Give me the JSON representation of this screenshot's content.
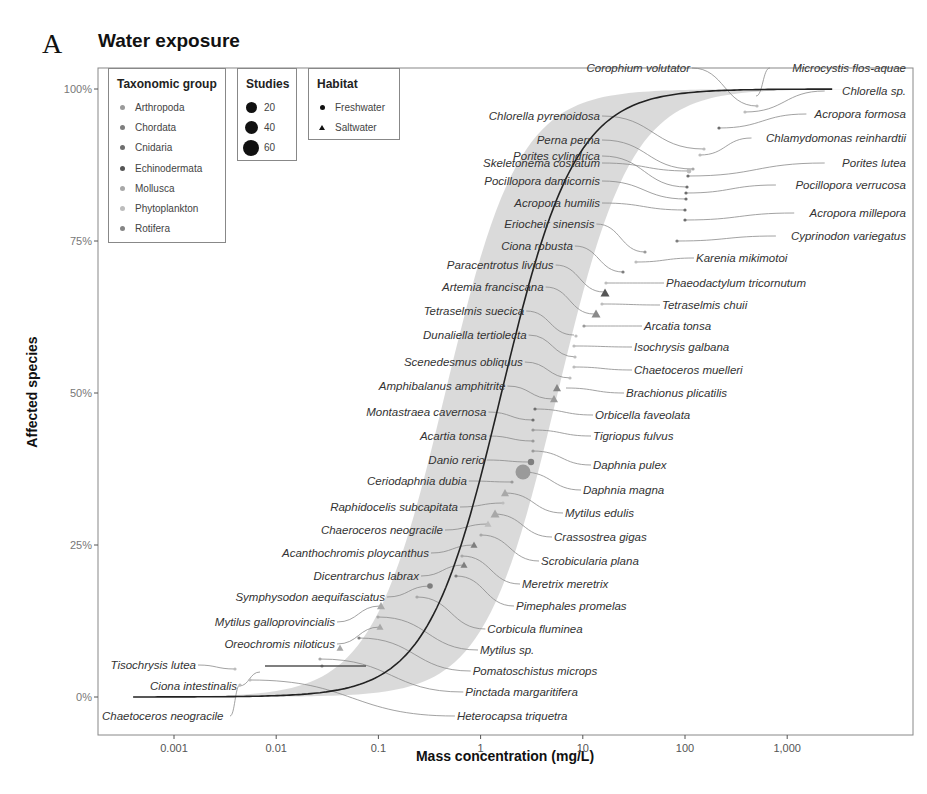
{
  "panel_letter": "A",
  "chart_data": {
    "type": "scatter",
    "title": "Water exposure",
    "xlabel": "Mass concentration (mg/L)",
    "ylabel": "Affected species",
    "x_scale": "log10",
    "x_ticks": [
      "0.001",
      "0.01",
      "0.1",
      "1",
      "10",
      "100",
      "1,000"
    ],
    "y_ticks": [
      "0%",
      "25%",
      "50%",
      "75%",
      "100%"
    ],
    "ylim": [
      0,
      100
    ],
    "grid": false,
    "fit": {
      "type": "sigmoid SSD curve with grey confidence band",
      "x_range_mg_L": [
        0.0004,
        3000
      ]
    },
    "legends": {
      "taxonomic_group": {
        "title": "Taxonomic group",
        "items": [
          {
            "label": "Arthropoda",
            "color": "#9a9a9a"
          },
          {
            "label": "Chordata",
            "color": "#7e7e7e"
          },
          {
            "label": "Cnidaria",
            "color": "#6e6e6e"
          },
          {
            "label": "Echinodermata",
            "color": "#555555"
          },
          {
            "label": "Mollusca",
            "color": "#a8a8a8"
          },
          {
            "label": "Phytoplankton",
            "color": "#bdbdbd"
          },
          {
            "label": "Rotifera",
            "color": "#858585"
          }
        ]
      },
      "studies": {
        "title": "Studies",
        "items": [
          {
            "label": "20",
            "size": 11
          },
          {
            "label": "40",
            "size": 13
          },
          {
            "label": "60",
            "size": 16
          }
        ]
      },
      "habitat": {
        "title": "Habitat",
        "items": [
          {
            "label": "Freshwater",
            "shape": "circle"
          },
          {
            "label": "Saltwater",
            "shape": "triangle"
          }
        ]
      }
    },
    "species_right": [
      {
        "name": "Microcystis flos-aquae",
        "x": 520,
        "y": 98.5
      },
      {
        "name": "Chlorella sp.",
        "x": 1000,
        "y": 97.5
      },
      {
        "name": "Corophium volutator",
        "x": 420,
        "y": 96.5
      },
      {
        "name": "Acropora formosa",
        "x": 330,
        "y": 95.5
      },
      {
        "name": "Chlorella pyrenoidosa",
        "x": 200,
        "y": 94.5
      },
      {
        "name": "Chlamydomonas reinhardtii",
        "x": 160,
        "y": 93
      },
      {
        "name": "Perna perna",
        "x": 140,
        "y": 91.5
      },
      {
        "name": "Skeletonema costatum",
        "x": 120,
        "y": 90
      },
      {
        "name": "Porites lutea",
        "x": 110,
        "y": 88.5
      },
      {
        "name": "Porites cylindrica",
        "x": 100,
        "y": 87
      },
      {
        "name": "Pocillopora verrucosa",
        "x": 100,
        "y": 85.5
      },
      {
        "name": "Pocillopora damicornis",
        "x": 100,
        "y": 84
      },
      {
        "name": "Acropora millepora",
        "x": 100,
        "y": 82.5
      },
      {
        "name": "Acropora humilis",
        "x": 100,
        "y": 81
      },
      {
        "name": "Cyprinodon variegatus",
        "x": 90,
        "y": 79.5
      },
      {
        "name": "Eriocheir sinensis",
        "x": 25,
        "y": 78
      },
      {
        "name": "Karenia mikimotoi",
        "x": 20,
        "y": 76.5
      },
      {
        "name": "Ciona robusta",
        "x": 18,
        "y": 75
      },
      {
        "name": "Phaeodactylum tricornutum",
        "x": 15,
        "y": 72.5
      },
      {
        "name": "Paracentrotus lividus",
        "x": 14,
        "y": 71.5
      },
      {
        "name": "Tetraselmis chuii",
        "x": 13,
        "y": 70
      },
      {
        "name": "Artemia franciscana",
        "x": 12,
        "y": 69
      },
      {
        "name": "Arcatia tonsa",
        "x": 8,
        "y": 67
      },
      {
        "name": "Tetraselmis suecica",
        "x": 8,
        "y": 66
      },
      {
        "name": "Isochrysis galbana",
        "x": 7,
        "y": 63.5
      },
      {
        "name": "Dunaliella tertiolecta",
        "x": 7,
        "y": 62.5
      },
      {
        "name": "Chaetoceros muelleri",
        "x": 6.5,
        "y": 60
      },
      {
        "name": "Scenedesmus obliquus",
        "x": 6,
        "y": 59
      },
      {
        "name": "Brachionus plicatilis",
        "x": 5,
        "y": 57
      },
      {
        "name": "Amphibalanus amphitrite",
        "x": 4.5,
        "y": 55.5
      },
      {
        "name": "Orbicella faveolata",
        "x": 3.5,
        "y": 54
      },
      {
        "name": "Montastraea cavernosa",
        "x": 3.3,
        "y": 53
      },
      {
        "name": "Tigriopus fulvus",
        "x": 3.2,
        "y": 51
      },
      {
        "name": "Acartia tonsa",
        "x": 3.1,
        "y": 50
      },
      {
        "name": "Daphnia pulex",
        "x": 3,
        "y": 48
      },
      {
        "name": "Danio rerio",
        "x": 3,
        "y": 47
      },
      {
        "name": "Daphnia magna",
        "x": 2.5,
        "y": 45,
        "studies": 60
      },
      {
        "name": "Ceriodaphnia dubia",
        "x": 2,
        "y": 44
      },
      {
        "name": "Mytilus edulis",
        "x": 2,
        "y": 42
      },
      {
        "name": "Raphidocelis subcapitata",
        "x": 1.8,
        "y": 41
      },
      {
        "name": "Crassostrea gigas",
        "x": 1.5,
        "y": 39
      },
      {
        "name": "Chaeroceros neogracile",
        "x": 1.3,
        "y": 37.5
      },
      {
        "name": "Scrobicularia plana",
        "x": 1.1,
        "y": 36
      },
      {
        "name": "Acanthochromis ploycanthus",
        "x": 1,
        "y": 34.5
      },
      {
        "name": "Meretrix meretrix",
        "x": 0.8,
        "y": 33
      },
      {
        "name": "Dicentrarchus labrax",
        "x": 0.8,
        "y": 31.5
      },
      {
        "name": "Pimephales promelas",
        "x": 0.7,
        "y": 30
      },
      {
        "name": "Symphysodon aequifasciatus",
        "x": 0.35,
        "y": 28.5
      },
      {
        "name": "Corbicula fluminea",
        "x": 0.1,
        "y": 27
      },
      {
        "name": "Mytilus galloprovincialis",
        "x": 0.1,
        "y": 25.5
      },
      {
        "name": "Mytilus sp.",
        "x": 0.1,
        "y": 24
      },
      {
        "name": "Oreochromis niloticus",
        "x": 0.07,
        "y": 22.5
      },
      {
        "name": "Pomatoschistus microps",
        "x": 0.04,
        "y": 21
      },
      {
        "name": "Tisochrysis lutea",
        "x": 0.004,
        "y": 19.5
      },
      {
        "name": "Pinctada margaritifera",
        "x": 0.03,
        "y": 18
      },
      {
        "name": "Ciona intestinalis",
        "x": 0.004,
        "y": 16.5
      },
      {
        "name": "Heterocapsa triquetra",
        "x": 0.004,
        "y": 15
      },
      {
        "name": "Chaetoceros neogracile",
        "x": 0.004,
        "y": 13.5
      }
    ]
  },
  "labels_left": [
    {
      "text": "Chlorella pyrenoidosa",
      "ly": 116,
      "tx": 704,
      "ty": 149
    },
    {
      "text": "Perna perna",
      "ly": 140,
      "tx": 693,
      "ty": 169
    },
    {
      "text": "Skeletonema costatum",
      "ly": 163,
      "tx": 689,
      "ty": 171
    },
    {
      "text": "Porites cylindrica",
      "ly": 156,
      "tx": 687,
      "ty": 187
    },
    {
      "text": "Pocillopora damicornis",
      "ly": 181,
      "tx": 686,
      "ty": 199
    },
    {
      "text": "Acropora humilis",
      "ly": 203,
      "tx": 685,
      "ty": 210
    },
    {
      "text": "Eriocheir sinensis",
      "ly": 224,
      "tx": 645,
      "ty": 252
    },
    {
      "text": "Ciona robusta",
      "ly": 246,
      "tx": 623,
      "ty": 272
    },
    {
      "text": "Paracentrotus lividus",
      "ly": 265,
      "tx": 604,
      "ty": 292
    },
    {
      "text": "Artemia franciscana",
      "ly": 287,
      "tx": 594,
      "ty": 314
    },
    {
      "text": "Tetraselmis suecica",
      "ly": 311,
      "tx": 574,
      "ty": 335
    },
    {
      "text": "Dunaliella tertiolecta",
      "ly": 335,
      "tx": 576,
      "ty": 357
    },
    {
      "text": "Scenedesmus obliquus",
      "ly": 362,
      "tx": 571,
      "ty": 378
    },
    {
      "text": "Amphibalanus amphitrite",
      "ly": 386,
      "tx": 553,
      "ty": 399
    },
    {
      "text": "Montastraea cavernosa",
      "ly": 412,
      "tx": 533,
      "ty": 420
    },
    {
      "text": "Acartia tonsa",
      "ly": 436,
      "tx": 533,
      "ty": 441
    },
    {
      "text": "Danio rerio",
      "ly": 460,
      "tx": 530,
      "ty": 462
    },
    {
      "text": "Ceriodaphnia dubia",
      "ly": 481,
      "tx": 512,
      "ty": 482
    },
    {
      "text": "Raphidocelis subcapitata",
      "ly": 507,
      "tx": 503,
      "ty": 503
    },
    {
      "text": "Chaeroceros neogracile",
      "ly": 530,
      "tx": 488,
      "ty": 524
    },
    {
      "text": "Acanthochromis ploycanthus",
      "ly": 553,
      "tx": 474,
      "ty": 545
    },
    {
      "text": "Dicentrarchus labrax",
      "ly": 576,
      "tx": 464,
      "ty": 565
    },
    {
      "text": "Symphysodon aequifasciatus",
      "ly": 597,
      "tx": 430,
      "ty": 586
    },
    {
      "text": "Mytilus galloprovincialis",
      "ly": 622,
      "tx": 380,
      "ty": 606
    },
    {
      "text": "Oreochromis niloticus",
      "ly": 644,
      "tx": 380,
      "ty": 627
    },
    {
      "text": "Tisochrysis lutea",
      "ly": 665,
      "tx": 235,
      "ty": 669
    },
    {
      "text": "Ciona intestinalis",
      "ly": 686,
      "tx": 260,
      "ty": 672
    },
    {
      "text": "Chaetoceros neogracile",
      "ly": 716,
      "tx": 240,
      "ty": 685
    }
  ],
  "labels_right": [
    {
      "text": "Corophium volutator",
      "ly": 68,
      "tx": 757,
      "ty": 106,
      "side": "left"
    },
    {
      "text": "Microcystis flos-aquae",
      "ly": 68,
      "tx": 756,
      "ty": 96
    },
    {
      "text": "Chlorella sp.",
      "ly": 91,
      "tx": 745,
      "ty": 112
    },
    {
      "text": "Acropora formosa",
      "ly": 114,
      "tx": 719,
      "ty": 128
    },
    {
      "text": "Chlamydomonas reinhardtii",
      "ly": 138,
      "tx": 700,
      "ty": 155
    },
    {
      "text": "Porites lutea",
      "ly": 163,
      "tx": 688,
      "ty": 176
    },
    {
      "text": "Pocillopora verrucosa",
      "ly": 185,
      "tx": 686,
      "ty": 193
    },
    {
      "text": "Acropora millepora",
      "ly": 213,
      "tx": 685,
      "ty": 220
    },
    {
      "text": "Cyprinodon variegatus",
      "ly": 236,
      "tx": 677,
      "ty": 241
    },
    {
      "text": "Karenia mikimotoi",
      "ly": 258,
      "tx": 636,
      "ty": 262
    },
    {
      "text": "Phaeodactylum tricornutum",
      "ly": 283,
      "tx": 606,
      "ty": 283
    },
    {
      "text": "Tetraselmis chuii",
      "ly": 305,
      "tx": 602,
      "ty": 304
    },
    {
      "text": "Arcatia tonsa",
      "ly": 326,
      "tx": 584,
      "ty": 326
    },
    {
      "text": "Isochrysis galbana",
      "ly": 347,
      "tx": 574,
      "ty": 346
    },
    {
      "text": "Chaetoceros muelleri",
      "ly": 370,
      "tx": 574,
      "ty": 367
    },
    {
      "text": "Brachionus plicatilis",
      "ly": 393,
      "tx": 566,
      "ty": 388
    },
    {
      "text": "Orbicella faveolata",
      "ly": 415,
      "tx": 535,
      "ty": 409
    },
    {
      "text": "Tigriopus fulvus",
      "ly": 436,
      "tx": 533,
      "ty": 430
    },
    {
      "text": "Daphnia pulex",
      "ly": 465,
      "tx": 533,
      "ty": 451
    },
    {
      "text": "Daphnia magna",
      "ly": 490,
      "tx": 523,
      "ty": 472
    },
    {
      "text": "Mytilus edulis",
      "ly": 513,
      "tx": 505,
      "ty": 493
    },
    {
      "text": "Crassostrea gigas",
      "ly": 537,
      "tx": 494,
      "ty": 514
    },
    {
      "text": "Scrobicularia plana",
      "ly": 561,
      "tx": 481,
      "ty": 535
    },
    {
      "text": "Meretrix meretrix",
      "ly": 584,
      "tx": 462,
      "ty": 556
    },
    {
      "text": "Pimephales promelas",
      "ly": 606,
      "tx": 456,
      "ty": 576
    },
    {
      "text": "Corbicula fluminea",
      "ly": 629,
      "tx": 417,
      "ty": 597
    },
    {
      "text": "Mytilus sp.",
      "ly": 650,
      "tx": 378,
      "ty": 617
    },
    {
      "text": "Pomatoschistus microps",
      "ly": 671,
      "tx": 359,
      "ty": 638
    },
    {
      "text": "Pinctada margaritifera",
      "ly": 692,
      "tx": 320,
      "ty": 659
    },
    {
      "text": "Heterocapsa triquetra",
      "ly": 716,
      "tx": 250,
      "ty": 680
    }
  ],
  "markers": [
    {
      "x": 757,
      "y": 106,
      "shape": "circle",
      "r": 1.6,
      "c": "#bdbdbd"
    },
    {
      "x": 745,
      "y": 112,
      "shape": "circle",
      "r": 1.6,
      "c": "#bdbdbd"
    },
    {
      "x": 719,
      "y": 128,
      "shape": "circle",
      "r": 1.6,
      "c": "#6e6e6e"
    },
    {
      "x": 704,
      "y": 149,
      "shape": "circle",
      "r": 1.6,
      "c": "#bdbdbd"
    },
    {
      "x": 700,
      "y": 155,
      "shape": "circle",
      "r": 1.6,
      "c": "#bdbdbd"
    },
    {
      "x": 693,
      "y": 169,
      "shape": "circle",
      "r": 1.6,
      "c": "#a8a8a8"
    },
    {
      "x": 689,
      "y": 171,
      "shape": "circle",
      "r": 2.4,
      "c": "#bdbdbd"
    },
    {
      "x": 688,
      "y": 176,
      "shape": "circle",
      "r": 1.6,
      "c": "#6e6e6e"
    },
    {
      "x": 687,
      "y": 187,
      "shape": "circle",
      "r": 1.6,
      "c": "#6e6e6e"
    },
    {
      "x": 686,
      "y": 193,
      "shape": "circle",
      "r": 1.6,
      "c": "#6e6e6e"
    },
    {
      "x": 686,
      "y": 199,
      "shape": "circle",
      "r": 1.6,
      "c": "#6e6e6e"
    },
    {
      "x": 685,
      "y": 210,
      "shape": "circle",
      "r": 1.6,
      "c": "#6e6e6e"
    },
    {
      "x": 685,
      "y": 220,
      "shape": "circle",
      "r": 1.6,
      "c": "#6e6e6e"
    },
    {
      "x": 677,
      "y": 241,
      "shape": "circle",
      "r": 1.6,
      "c": "#7e7e7e"
    },
    {
      "x": 645,
      "y": 252,
      "shape": "circle",
      "r": 1.6,
      "c": "#9a9a9a"
    },
    {
      "x": 636,
      "y": 262,
      "shape": "circle",
      "r": 1.6,
      "c": "#bdbdbd"
    },
    {
      "x": 623,
      "y": 272,
      "shape": "circle",
      "r": 1.6,
      "c": "#7e7e7e"
    },
    {
      "x": 606,
      "y": 283,
      "shape": "circle",
      "r": 1.6,
      "c": "#bdbdbd"
    },
    {
      "x": 605,
      "y": 293,
      "shape": "triangle",
      "s": 4.5,
      "c": "#555555"
    },
    {
      "x": 602,
      "y": 304,
      "shape": "circle",
      "r": 1.6,
      "c": "#bdbdbd"
    },
    {
      "x": 596,
      "y": 314,
      "shape": "triangle",
      "s": 4.5,
      "c": "#8a8a8a"
    },
    {
      "x": 584,
      "y": 326,
      "shape": "circle",
      "r": 1.6,
      "c": "#9a9a9a"
    },
    {
      "x": 576,
      "y": 336,
      "shape": "circle",
      "r": 1.6,
      "c": "#bdbdbd"
    },
    {
      "x": 574,
      "y": 346,
      "shape": "circle",
      "r": 1.6,
      "c": "#bdbdbd"
    },
    {
      "x": 575,
      "y": 357,
      "shape": "circle",
      "r": 1.6,
      "c": "#bdbdbd"
    },
    {
      "x": 574,
      "y": 367,
      "shape": "circle",
      "r": 1.6,
      "c": "#bdbdbd"
    },
    {
      "x": 570,
      "y": 378,
      "shape": "circle",
      "r": 1.6,
      "c": "#bdbdbd"
    },
    {
      "x": 557,
      "y": 388,
      "shape": "triangle",
      "s": 4,
      "c": "#858585"
    },
    {
      "x": 554,
      "y": 399,
      "shape": "triangle",
      "s": 4,
      "c": "#9a9a9a"
    },
    {
      "x": 535,
      "y": 409,
      "shape": "circle",
      "r": 1.6,
      "c": "#6e6e6e"
    },
    {
      "x": 533,
      "y": 420,
      "shape": "circle",
      "r": 1.6,
      "c": "#6e6e6e"
    },
    {
      "x": 533,
      "y": 430,
      "shape": "circle",
      "r": 1.6,
      "c": "#9a9a9a"
    },
    {
      "x": 533,
      "y": 441,
      "shape": "circle",
      "r": 1.6,
      "c": "#9a9a9a"
    },
    {
      "x": 533,
      "y": 451,
      "shape": "circle",
      "r": 1.6,
      "c": "#9a9a9a"
    },
    {
      "x": 531,
      "y": 462,
      "shape": "circle",
      "r": 3.2,
      "c": "#7e7e7e"
    },
    {
      "x": 523,
      "y": 472,
      "shape": "circle",
      "r": 7.5,
      "c": "#9a9a9a"
    },
    {
      "x": 512,
      "y": 482,
      "shape": "circle",
      "r": 1.6,
      "c": "#9a9a9a"
    },
    {
      "x": 505,
      "y": 493,
      "shape": "triangle",
      "s": 4,
      "c": "#a8a8a8"
    },
    {
      "x": 503,
      "y": 503,
      "shape": "circle",
      "r": 1.6,
      "c": "#bdbdbd"
    },
    {
      "x": 495,
      "y": 514,
      "shape": "triangle",
      "s": 4.5,
      "c": "#a8a8a8"
    },
    {
      "x": 488,
      "y": 524,
      "shape": "triangle",
      "s": 3.5,
      "c": "#bdbdbd"
    },
    {
      "x": 481,
      "y": 535,
      "shape": "circle",
      "r": 1.6,
      "c": "#a8a8a8"
    },
    {
      "x": 474,
      "y": 545,
      "shape": "triangle",
      "s": 3.5,
      "c": "#7e7e7e"
    },
    {
      "x": 462,
      "y": 556,
      "shape": "circle",
      "r": 1.6,
      "c": "#a8a8a8"
    },
    {
      "x": 464,
      "y": 565,
      "shape": "triangle",
      "s": 3.5,
      "c": "#7e7e7e"
    },
    {
      "x": 456,
      "y": 576,
      "shape": "circle",
      "r": 1.6,
      "c": "#7e7e7e"
    },
    {
      "x": 430,
      "y": 586,
      "shape": "circle",
      "r": 2.8,
      "c": "#7e7e7e"
    },
    {
      "x": 417,
      "y": 597,
      "shape": "circle",
      "r": 1.6,
      "c": "#a8a8a8"
    },
    {
      "x": 381,
      "y": 606,
      "shape": "triangle",
      "s": 4,
      "c": "#a8a8a8"
    },
    {
      "x": 378,
      "y": 617,
      "shape": "circle",
      "r": 1.6,
      "c": "#a8a8a8"
    },
    {
      "x": 380,
      "y": 627,
      "shape": "triangle",
      "s": 3.5,
      "c": "#a8a8a8"
    },
    {
      "x": 359,
      "y": 638,
      "shape": "circle",
      "r": 1.6,
      "c": "#7e7e7e"
    },
    {
      "x": 340,
      "y": 648,
      "shape": "triangle",
      "s": 3.5,
      "c": "#a8a8a8"
    },
    {
      "x": 320,
      "y": 659,
      "shape": "circle",
      "r": 1.6,
      "c": "#a8a8a8"
    },
    {
      "x": 235,
      "y": 669,
      "shape": "circle",
      "r": 1.6,
      "c": "#bdbdbd"
    },
    {
      "x": 322,
      "y": 666,
      "shape": "circle",
      "r": 1.6,
      "c": "#7e7e7e"
    },
    {
      "x": 250,
      "y": 680,
      "shape": "circle",
      "r": 1.6,
      "c": "#bdbdbd"
    },
    {
      "x": 240,
      "y": 685,
      "shape": "circle",
      "r": 1.6,
      "c": "#bdbdbd"
    }
  ],
  "errorbar": {
    "x1": 265,
    "x2": 366,
    "y": 666
  }
}
